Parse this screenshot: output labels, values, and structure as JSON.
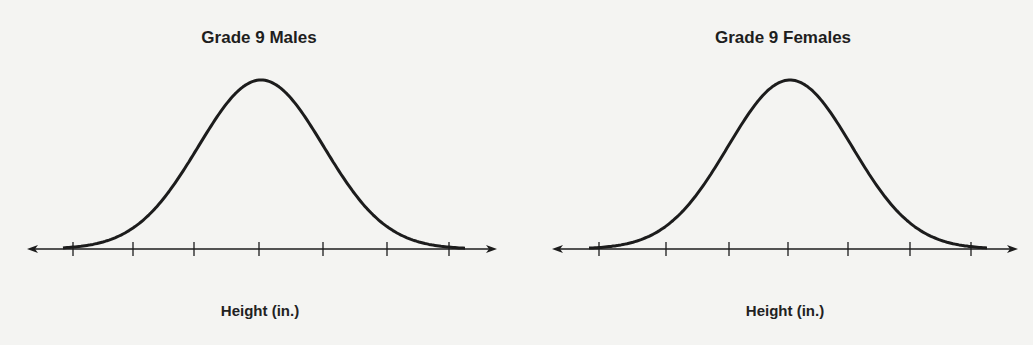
{
  "chart_data": [
    {
      "type": "line",
      "subtype": "normal-distribution-curve",
      "title": "Grade 9 Males",
      "xlabel": "Height (in.)",
      "ylabel": "",
      "tick_count": 7,
      "tick_labels": [
        "",
        "",
        "",
        "",
        "",
        "",
        ""
      ],
      "distribution": {
        "mean_tick_index": 3,
        "sd_in_ticks": 1
      },
      "grid": false,
      "axis_arrows": true
    },
    {
      "type": "line",
      "subtype": "normal-distribution-curve",
      "title": "Grade 9 Females",
      "xlabel": "Height (in.)",
      "ylabel": "",
      "tick_count": 7,
      "tick_labels": [
        "",
        "",
        "",
        "",
        "",
        "",
        ""
      ],
      "distribution": {
        "mean_tick_index": 3,
        "sd_in_ticks": 1
      },
      "grid": false,
      "axis_arrows": true
    }
  ],
  "colors": {
    "ink": "#1c1c1c",
    "background": "#f4f4f2"
  }
}
